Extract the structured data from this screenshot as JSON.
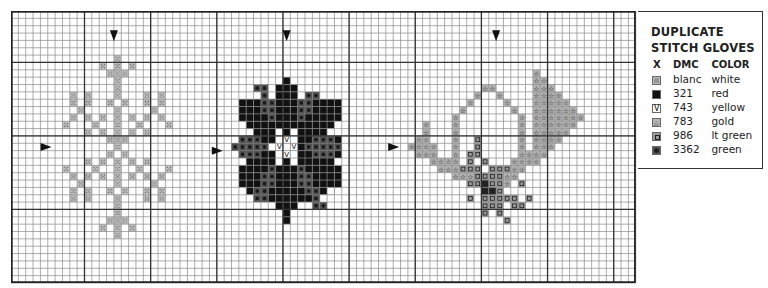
{
  "legend": {
    "title_line1": "DUPLICATE",
    "title_line2": "STITCH GLOVES",
    "headers": {
      "x": "X",
      "dmc": "DMC",
      "color": "COLOR"
    },
    "rows": [
      {
        "symbol": "dotted",
        "dmc": "blanc",
        "color": "white",
        "swatch": "#bdbdbd"
      },
      {
        "symbol": "solid",
        "dmc": "321",
        "color": "red",
        "swatch": "#111111"
      },
      {
        "symbol": "v",
        "dmc": "743",
        "color": "yellow",
        "swatch": "#ffffff"
      },
      {
        "symbol": "star",
        "dmc": "783",
        "color": "gold",
        "swatch": "#b5b5b5"
      },
      {
        "symbol": "square",
        "dmc": "986",
        "color": "lt green",
        "swatch": "#9a9a9a"
      },
      {
        "symbol": "circle",
        "dmc": "3362",
        "color": "green",
        "swatch": "#555555"
      }
    ]
  },
  "grid": {
    "cols": 85,
    "rows": 37,
    "cell": 7.35,
    "heavy_cols": [
      10,
      19,
      28,
      37,
      46,
      55,
      64,
      73,
      82
    ],
    "heavy_rows": [
      7,
      17,
      27
    ]
  },
  "arrows": {
    "down": [
      [
        14,
        3.3
      ],
      [
        37.5,
        3.3
      ],
      [
        66,
        3.3
      ]
    ],
    "right": [
      [
        4.7,
        18.5
      ],
      [
        28,
        19
      ],
      [
        52,
        18.5
      ]
    ]
  },
  "motifs": {
    "left": {
      "symbol": "dotted",
      "cells": [
        [
          14,
          6
        ],
        [
          12,
          7
        ],
        [
          14,
          7
        ],
        [
          16,
          7
        ],
        [
          13,
          8
        ],
        [
          14,
          8
        ],
        [
          15,
          8
        ],
        [
          14,
          9
        ],
        [
          14,
          10
        ],
        [
          8,
          11
        ],
        [
          10,
          11
        ],
        [
          14,
          11
        ],
        [
          18,
          11
        ],
        [
          20,
          11
        ],
        [
          8,
          12
        ],
        [
          10,
          12
        ],
        [
          13,
          12
        ],
        [
          15,
          12
        ],
        [
          18,
          12
        ],
        [
          20,
          12
        ],
        [
          9,
          13
        ],
        [
          14,
          13
        ],
        [
          19,
          13
        ],
        [
          8,
          14
        ],
        [
          10,
          14
        ],
        [
          12,
          14
        ],
        [
          14,
          14
        ],
        [
          16,
          14
        ],
        [
          18,
          14
        ],
        [
          20,
          14
        ],
        [
          7,
          15
        ],
        [
          11,
          15
        ],
        [
          14,
          15
        ],
        [
          17,
          15
        ],
        [
          21,
          15
        ],
        [
          10,
          16
        ],
        [
          12,
          16
        ],
        [
          14,
          16
        ],
        [
          16,
          16
        ],
        [
          18,
          16
        ],
        [
          13,
          17
        ],
        [
          14,
          17
        ],
        [
          15,
          17
        ],
        [
          14,
          18
        ],
        [
          13,
          19
        ],
        [
          15,
          19
        ],
        [
          10,
          20
        ],
        [
          12,
          20
        ],
        [
          14,
          20
        ],
        [
          16,
          20
        ],
        [
          18,
          20
        ],
        [
          7,
          21
        ],
        [
          11,
          21
        ],
        [
          14,
          21
        ],
        [
          17,
          21
        ],
        [
          21,
          21
        ],
        [
          8,
          22
        ],
        [
          10,
          22
        ],
        [
          12,
          22
        ],
        [
          14,
          22
        ],
        [
          16,
          22
        ],
        [
          18,
          22
        ],
        [
          20,
          22
        ],
        [
          9,
          23
        ],
        [
          14,
          23
        ],
        [
          19,
          23
        ],
        [
          8,
          24
        ],
        [
          10,
          24
        ],
        [
          13,
          24
        ],
        [
          15,
          24
        ],
        [
          18,
          24
        ],
        [
          20,
          24
        ],
        [
          8,
          25
        ],
        [
          10,
          25
        ],
        [
          14,
          25
        ],
        [
          18,
          25
        ],
        [
          20,
          25
        ],
        [
          14,
          26
        ],
        [
          14,
          27
        ],
        [
          13,
          28
        ],
        [
          14,
          28
        ],
        [
          15,
          28
        ],
        [
          12,
          29
        ],
        [
          14,
          29
        ],
        [
          16,
          29
        ],
        [
          14,
          30
        ]
      ]
    },
    "middle": {
      "solid_rows": [
        [
          9,
          37,
          37
        ],
        [
          10,
          36,
          38
        ],
        [
          11,
          36,
          38
        ],
        [
          12,
          31,
          44
        ],
        [
          13,
          31,
          44
        ],
        [
          14,
          31,
          44
        ],
        [
          15,
          32,
          43
        ],
        [
          16,
          33,
          42
        ],
        [
          17,
          31,
          44
        ],
        [
          18,
          30,
          44
        ],
        [
          19,
          31,
          44
        ],
        [
          20,
          32,
          43
        ],
        [
          21,
          31,
          44
        ],
        [
          22,
          31,
          44
        ],
        [
          23,
          31,
          44
        ],
        [
          24,
          32,
          43
        ],
        [
          25,
          33,
          42
        ],
        [
          26,
          36,
          38
        ],
        [
          27,
          37,
          37
        ],
        [
          28,
          37,
          37
        ]
      ],
      "green_cells": [
        [
          33,
          10
        ],
        [
          34,
          10
        ],
        [
          34,
          11
        ],
        [
          40,
          11
        ],
        [
          41,
          11
        ],
        [
          34,
          12
        ],
        [
          35,
          12
        ],
        [
          39,
          12
        ],
        [
          40,
          12
        ],
        [
          34,
          13
        ],
        [
          35,
          13
        ],
        [
          39,
          13
        ],
        [
          40,
          13
        ],
        [
          35,
          14
        ],
        [
          39,
          14
        ],
        [
          31,
          17
        ],
        [
          32,
          17
        ],
        [
          33,
          17
        ],
        [
          41,
          17
        ],
        [
          42,
          17
        ],
        [
          43,
          17
        ],
        [
          30,
          18
        ],
        [
          31,
          18
        ],
        [
          32,
          18
        ],
        [
          33,
          18
        ],
        [
          34,
          18
        ],
        [
          40,
          18
        ],
        [
          41,
          18
        ],
        [
          42,
          18
        ],
        [
          43,
          18
        ],
        [
          44,
          18
        ],
        [
          31,
          19
        ],
        [
          32,
          19
        ],
        [
          33,
          19
        ],
        [
          41,
          19
        ],
        [
          42,
          19
        ],
        [
          43,
          19
        ],
        [
          35,
          21
        ],
        [
          39,
          21
        ],
        [
          34,
          22
        ],
        [
          35,
          22
        ],
        [
          39,
          22
        ],
        [
          40,
          22
        ],
        [
          34,
          23
        ],
        [
          35,
          23
        ],
        [
          39,
          23
        ],
        [
          40,
          23
        ],
        [
          33,
          24
        ],
        [
          34,
          24
        ],
        [
          40,
          24
        ],
        [
          41,
          24
        ],
        [
          33,
          25
        ],
        [
          34,
          25
        ],
        [
          41,
          25
        ],
        [
          41,
          26
        ],
        [
          42,
          26
        ]
      ],
      "white_cells": [
        [
          36,
          16
        ],
        [
          38,
          16
        ],
        [
          36,
          17
        ],
        [
          38,
          17
        ],
        [
          35,
          18
        ],
        [
          37,
          18
        ],
        [
          36,
          19
        ],
        [
          38,
          19
        ],
        [
          36,
          20
        ],
        [
          38,
          20
        ],
        [
          30,
          15
        ],
        [
          44,
          15
        ],
        [
          31,
          16
        ],
        [
          43,
          16
        ],
        [
          30,
          20
        ],
        [
          44,
          20
        ],
        [
          32,
          25
        ],
        [
          42,
          25
        ],
        [
          31,
          24
        ],
        [
          43,
          24
        ]
      ],
      "v_cells": [
        [
          37,
          17
        ],
        [
          36,
          18
        ],
        [
          38,
          18
        ],
        [
          37,
          19
        ]
      ]
    },
    "right": {
      "star_cells": [
        [
          71,
          8
        ],
        [
          71,
          9
        ],
        [
          72,
          9
        ],
        [
          64,
          10
        ],
        [
          65,
          10
        ],
        [
          71,
          10
        ],
        [
          72,
          10
        ],
        [
          73,
          10
        ],
        [
          63,
          11
        ],
        [
          66,
          11
        ],
        [
          71,
          11
        ],
        [
          72,
          11
        ],
        [
          73,
          11
        ],
        [
          74,
          11
        ],
        [
          62,
          12
        ],
        [
          67,
          12
        ],
        [
          71,
          12
        ],
        [
          72,
          12
        ],
        [
          73,
          12
        ],
        [
          74,
          12
        ],
        [
          75,
          12
        ],
        [
          61,
          13
        ],
        [
          68,
          13
        ],
        [
          71,
          13
        ],
        [
          72,
          13
        ],
        [
          73,
          13
        ],
        [
          74,
          13
        ],
        [
          75,
          13
        ],
        [
          76,
          13
        ],
        [
          60,
          14
        ],
        [
          69,
          14
        ],
        [
          71,
          14
        ],
        [
          72,
          14
        ],
        [
          73,
          14
        ],
        [
          74,
          14
        ],
        [
          75,
          14
        ],
        [
          76,
          14
        ],
        [
          77,
          14
        ],
        [
          56,
          15
        ],
        [
          60,
          15
        ],
        [
          69,
          15
        ],
        [
          71,
          15
        ],
        [
          72,
          15
        ],
        [
          73,
          15
        ],
        [
          74,
          15
        ],
        [
          75,
          15
        ],
        [
          76,
          15
        ],
        [
          56,
          16
        ],
        [
          60,
          16
        ],
        [
          69,
          16
        ],
        [
          71,
          16
        ],
        [
          72,
          16
        ],
        [
          73,
          16
        ],
        [
          74,
          16
        ],
        [
          75,
          16
        ],
        [
          55,
          17
        ],
        [
          56,
          17
        ],
        [
          60,
          17
        ],
        [
          69,
          17
        ],
        [
          71,
          17
        ],
        [
          72,
          17
        ],
        [
          73,
          17
        ],
        [
          74,
          17
        ],
        [
          54,
          18
        ],
        [
          55,
          18
        ],
        [
          56,
          18
        ],
        [
          57,
          18
        ],
        [
          60,
          18
        ],
        [
          69,
          18
        ],
        [
          71,
          18
        ],
        [
          72,
          18
        ],
        [
          73,
          18
        ],
        [
          55,
          19
        ],
        [
          56,
          19
        ],
        [
          57,
          19
        ],
        [
          60,
          19
        ],
        [
          69,
          19
        ],
        [
          70,
          19
        ],
        [
          71,
          19
        ],
        [
          72,
          19
        ],
        [
          57,
          20
        ],
        [
          58,
          20
        ],
        [
          59,
          20
        ],
        [
          60,
          20
        ],
        [
          68,
          20
        ],
        [
          69,
          20
        ],
        [
          70,
          20
        ],
        [
          71,
          20
        ],
        [
          58,
          21
        ],
        [
          59,
          21
        ],
        [
          60,
          21
        ],
        [
          68,
          21
        ],
        [
          69,
          21
        ],
        [
          60,
          22
        ],
        [
          61,
          22
        ],
        [
          62,
          22
        ],
        [
          67,
          22
        ],
        [
          68,
          22
        ],
        [
          67,
          23
        ]
      ],
      "square_cells": [
        [
          63,
          17
        ],
        [
          63,
          18
        ],
        [
          62,
          19
        ],
        [
          63,
          19
        ],
        [
          62,
          20
        ],
        [
          64,
          20
        ],
        [
          61,
          21
        ],
        [
          62,
          21
        ],
        [
          63,
          21
        ],
        [
          65,
          21
        ],
        [
          66,
          21
        ],
        [
          67,
          21
        ],
        [
          63,
          22
        ],
        [
          64,
          22
        ],
        [
          65,
          22
        ],
        [
          66,
          22
        ],
        [
          62,
          23
        ],
        [
          63,
          23
        ],
        [
          65,
          23
        ],
        [
          66,
          23
        ],
        [
          69,
          23
        ],
        [
          66,
          24
        ],
        [
          62,
          25
        ],
        [
          64,
          25
        ],
        [
          65,
          25
        ],
        [
          66,
          25
        ],
        [
          67,
          25
        ],
        [
          68,
          25
        ],
        [
          70,
          25
        ],
        [
          64,
          26
        ],
        [
          65,
          26
        ],
        [
          66,
          26
        ],
        [
          68,
          26
        ],
        [
          69,
          26
        ],
        [
          64,
          27
        ],
        [
          66,
          27
        ],
        [
          67,
          28
        ]
      ],
      "dark_cells": [
        [
          64,
          23
        ],
        [
          64,
          24
        ],
        [
          65,
          24
        ]
      ]
    }
  }
}
